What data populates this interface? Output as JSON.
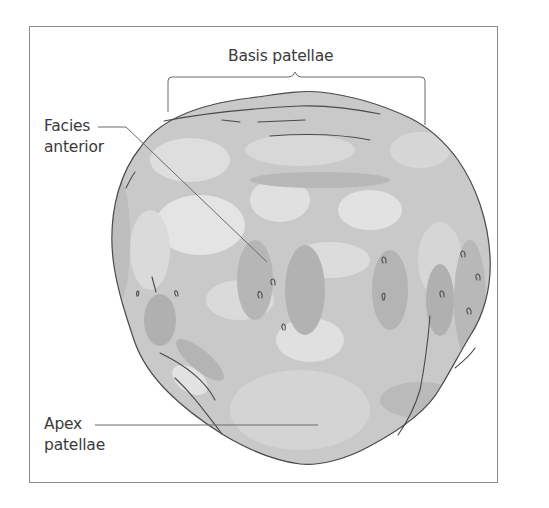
{
  "figure": {
    "labels": {
      "basis": "Basis patellae",
      "facies_line1": "Facies",
      "facies_line2": "anterior",
      "apex_line1": "Apex",
      "apex_line2": "patellae"
    },
    "colors": {
      "frame": "#8a8a8a",
      "bone_base": "#c9c9c9",
      "bone_light": "#e2e2e2",
      "bone_dark": "#ababab",
      "outline": "#4a4a4a",
      "leader": "#6a6a6a",
      "text": "#3a3a3a"
    }
  }
}
